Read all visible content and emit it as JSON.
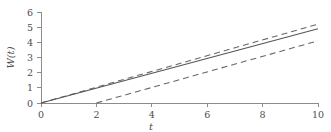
{
  "chart_data": {
    "type": "line",
    "title": "",
    "subtitle": "",
    "xlabel": "t",
    "ylabel": "W(t)",
    "xlim": [
      0,
      10
    ],
    "ylim": [
      0,
      6
    ],
    "xticks": [
      0,
      2,
      4,
      6,
      8,
      10
    ],
    "yticks": [
      0,
      1,
      2,
      3,
      4,
      5,
      6
    ],
    "xticklabels": [
      "0",
      "2",
      "4",
      "6",
      "8",
      "10"
    ],
    "yticklabels": [
      "0",
      "1",
      "2",
      "3",
      "4",
      "5",
      "6"
    ],
    "grid": false,
    "legend": null,
    "legend_position": "none",
    "annotations": [],
    "series": [
      {
        "name": "upper-bound",
        "style": "dashed",
        "color": "#666666",
        "x": [
          0,
          10
        ],
        "values": [
          0,
          5.2
        ]
      },
      {
        "name": "mean",
        "style": "solid",
        "color": "#555555",
        "x": [
          0,
          10
        ],
        "values": [
          0,
          4.9
        ]
      },
      {
        "name": "lower-bound",
        "style": "dashed",
        "color": "#666666",
        "x": [
          2,
          10
        ],
        "values": [
          0,
          4.1
        ]
      }
    ]
  },
  "axes": {
    "x_title": "t",
    "y_title": "W(t)",
    "x_tick_0": "0",
    "x_tick_1": "2",
    "x_tick_2": "4",
    "x_tick_3": "6",
    "x_tick_4": "8",
    "x_tick_5": "10",
    "y_tick_0": "0",
    "y_tick_1": "1",
    "y_tick_2": "2",
    "y_tick_3": "3",
    "y_tick_4": "4",
    "y_tick_5": "5",
    "y_tick_6": "6"
  }
}
